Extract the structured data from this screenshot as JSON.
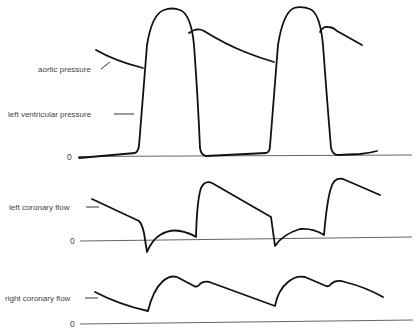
{
  "panels": {
    "pressure": {
      "labels": {
        "aortic": "aortic pressure",
        "lv": "left ventricular pressure",
        "zero": "0"
      }
    },
    "left_coronary": {
      "label": "left coronary flow",
      "zero": "0"
    },
    "right_coronary": {
      "label": "right coronary flow",
      "zero": "0"
    }
  },
  "colors": {
    "trace": "#111111",
    "baseline": "#555555",
    "text": "#444444",
    "background": "#ffffff"
  }
}
